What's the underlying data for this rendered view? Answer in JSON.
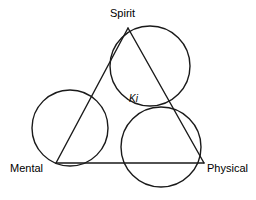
{
  "diagram": {
    "type": "venn-triangle-diagram",
    "background_color": "#ffffff",
    "stroke_color": "#1a1a1a",
    "stroke_width": 1.4,
    "vertices": [
      {
        "id": "spirit",
        "label": "Spirit",
        "x": 128,
        "y": 28
      },
      {
        "id": "mental",
        "label": "Mental",
        "x": 56,
        "y": 163
      },
      {
        "id": "physical",
        "label": "Physical",
        "x": 204,
        "y": 163
      }
    ],
    "center": {
      "id": "ki",
      "label": "Ki",
      "style": "italic",
      "x": 128,
      "y": 105
    },
    "edges": [
      {
        "id": "spirit-mental",
        "from": "spirit",
        "to": "mental"
      },
      {
        "id": "spirit-physical",
        "from": "spirit",
        "to": "physical"
      },
      {
        "id": "mental-physical",
        "from": "mental",
        "to": "physical"
      }
    ],
    "circles": [
      {
        "id": "left-circle",
        "cx": 70,
        "cy": 128,
        "r": 38,
        "spans": "spirit-mental edge"
      },
      {
        "id": "right-circle",
        "cx": 150,
        "cy": 66,
        "r": 40,
        "spans": "spirit-physical edge"
      },
      {
        "id": "bottom-circle",
        "cx": 161,
        "cy": 147,
        "r": 40,
        "spans": "mental-physical edge"
      }
    ],
    "labels": {
      "spirit": "Spirit",
      "mental": "Mental",
      "physical": "Physical",
      "ki": "Ki"
    }
  }
}
